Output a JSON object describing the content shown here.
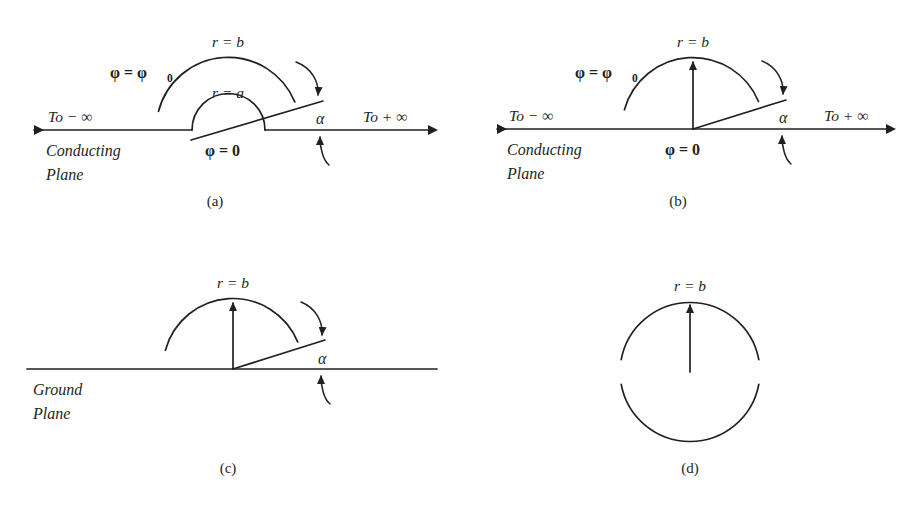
{
  "figure": {
    "background_color": "#ffffff",
    "ink_color": "#231f20",
    "panels": [
      {
        "id": "a",
        "caption": "(a)",
        "labels": {
          "outer_radius": "r = b",
          "inner_radius": "r = a",
          "potential_top": "φ = φ",
          "potential_top_sub": "0",
          "potential_bottom": "φ = 0",
          "angle": "α",
          "left_infinity": "To − ∞",
          "right_infinity": "To + ∞",
          "plane_line1": "Conducting",
          "plane_line2": "Plane"
        }
      },
      {
        "id": "b",
        "caption": "(b)",
        "labels": {
          "outer_radius": "r = b",
          "potential_top": "φ = φ",
          "potential_top_sub": "0",
          "potential_bottom": "φ = 0",
          "angle": "α",
          "left_infinity": "To − ∞",
          "right_infinity": "To + ∞",
          "plane_line1": "Conducting",
          "plane_line2": "Plane"
        }
      },
      {
        "id": "c",
        "caption": "(c)",
        "labels": {
          "outer_radius": "r = b",
          "angle": "α",
          "plane_line1": "Ground",
          "plane_line2": "Plane"
        }
      },
      {
        "id": "d",
        "caption": "(d)",
        "labels": {
          "outer_radius": "r = b"
        }
      }
    ]
  }
}
